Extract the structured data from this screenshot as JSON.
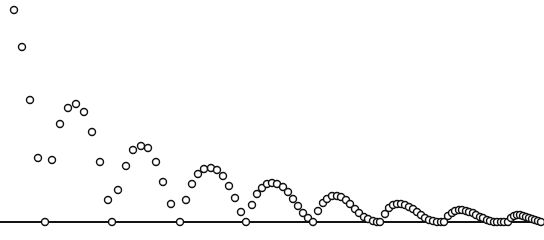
{
  "figure": {
    "title": "",
    "width": 544,
    "height": 240,
    "background_color": "#ffffff"
  },
  "axis": {
    "ground_line": {
      "name": "ground",
      "y_pixel": 222,
      "x_start": 0,
      "x_end": 544,
      "color": "#141414",
      "width": 2.1
    }
  },
  "marker_style": {
    "shape": "open-circle",
    "radius": 3.5,
    "fill_color": "#ffffff",
    "stroke_color": "#111111",
    "stroke_width": 1.45
  },
  "chart_data": {
    "type": "scatter",
    "title": "",
    "xlabel": "",
    "ylabel": "",
    "grid": false,
    "legend": "none",
    "xlim": [
      0,
      544
    ],
    "ylim": [
      240,
      0
    ],
    "ground_y": 222,
    "bounce_x": [
      45,
      112,
      180,
      246,
      313,
      380,
      444,
      508
    ],
    "apex_y": [
      230,
      105,
      145,
      168,
      183,
      196,
      204,
      210
    ],
    "series": [
      {
        "name": "ball-position",
        "x": [
          14,
          22,
          30,
          38,
          45,
          52,
          60,
          68,
          76,
          84,
          92,
          100,
          108,
          112,
          118,
          126,
          133,
          141,
          148,
          156,
          163,
          171,
          180,
          186,
          192,
          198,
          204,
          211,
          217,
          223,
          229,
          235,
          241,
          246,
          252,
          257,
          262,
          267,
          272,
          277,
          283,
          288,
          293,
          298,
          303,
          308,
          313,
          318,
          323,
          327,
          332,
          337,
          341,
          346,
          350,
          355,
          359,
          364,
          368,
          373,
          377,
          380,
          385,
          389,
          393,
          397,
          401,
          405,
          409,
          413,
          417,
          421,
          425,
          429,
          433,
          437,
          441,
          444,
          448,
          452,
          455,
          459,
          462,
          466,
          469,
          473,
          476,
          480,
          483,
          487,
          490,
          494,
          497,
          501,
          504,
          508,
          511,
          514,
          517,
          520,
          523,
          526,
          529,
          532,
          535,
          538,
          541
        ],
        "y": [
          10,
          47,
          100,
          158,
          222,
          160,
          124,
          108,
          104,
          112,
          132,
          162,
          200,
          222,
          190,
          166,
          150,
          146,
          148,
          162,
          182,
          204,
          222,
          200,
          184,
          174,
          169,
          168,
          170,
          176,
          186,
          198,
          212,
          222,
          205,
          194,
          188,
          184,
          183,
          184,
          187,
          192,
          199,
          206,
          213,
          218,
          222,
          211,
          203,
          199,
          196,
          196,
          197,
          200,
          204,
          209,
          213,
          217,
          219,
          221,
          222,
          222,
          214,
          208,
          205,
          204,
          204,
          205,
          207,
          209,
          212,
          215,
          218,
          220,
          221,
          222,
          222,
          222,
          216,
          213,
          211,
          210,
          210,
          211,
          212,
          213,
          215,
          217,
          218,
          220,
          221,
          222,
          222,
          222,
          222,
          222,
          218,
          216,
          215,
          215,
          216,
          217,
          218,
          219,
          220,
          221,
          222
        ]
      }
    ]
  }
}
